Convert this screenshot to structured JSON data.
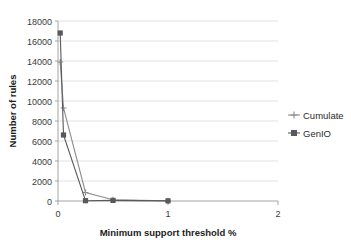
{
  "chart_data": {
    "type": "line",
    "title": "",
    "xlabel": "Minimum support threshold  %",
    "ylabel": "Number of rules",
    "xlim": [
      0,
      2
    ],
    "ylim": [
      0,
      18000
    ],
    "xticks": [
      "0",
      "1",
      "2"
    ],
    "xtick_values": [
      0,
      1,
      2
    ],
    "yticks": [
      "0",
      "2000",
      "4000",
      "6000",
      "8000",
      "10000",
      "12000",
      "14000",
      "16000",
      "18000"
    ],
    "ytick_values": [
      0,
      2000,
      4000,
      6000,
      8000,
      10000,
      12000,
      14000,
      16000,
      18000
    ],
    "grid": true,
    "legend_position": "right",
    "x": [
      0.02,
      0.05,
      0.25,
      0.5,
      1.0
    ],
    "series": [
      {
        "name": "Cumulate",
        "marker": "plus",
        "color": "#8c8c8c",
        "values": [
          13900,
          9300,
          850,
          120,
          20
        ]
      },
      {
        "name": "GenIO",
        "marker": "square",
        "color": "#595959",
        "values": [
          16800,
          6600,
          30,
          60,
          15
        ]
      }
    ]
  },
  "legend": {
    "items": [
      {
        "label": "Cumulate"
      },
      {
        "label": "GenIO"
      }
    ]
  },
  "axes": {
    "x_title": "Minimum support threshold  %",
    "y_title": "Number of rules"
  }
}
